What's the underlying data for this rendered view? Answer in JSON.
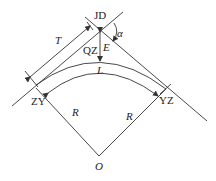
{
  "diagram": {
    "labels": {
      "jd": "JD",
      "alpha": "α",
      "t": "T",
      "e": "E",
      "qz": "QZ",
      "l": "L",
      "zy": "ZY",
      "yz": "YZ",
      "r_left": "R",
      "r_right": "R",
      "o": "O"
    },
    "colors": {
      "stroke": "#333333",
      "text": "#222222",
      "background": "#ffffff"
    }
  }
}
